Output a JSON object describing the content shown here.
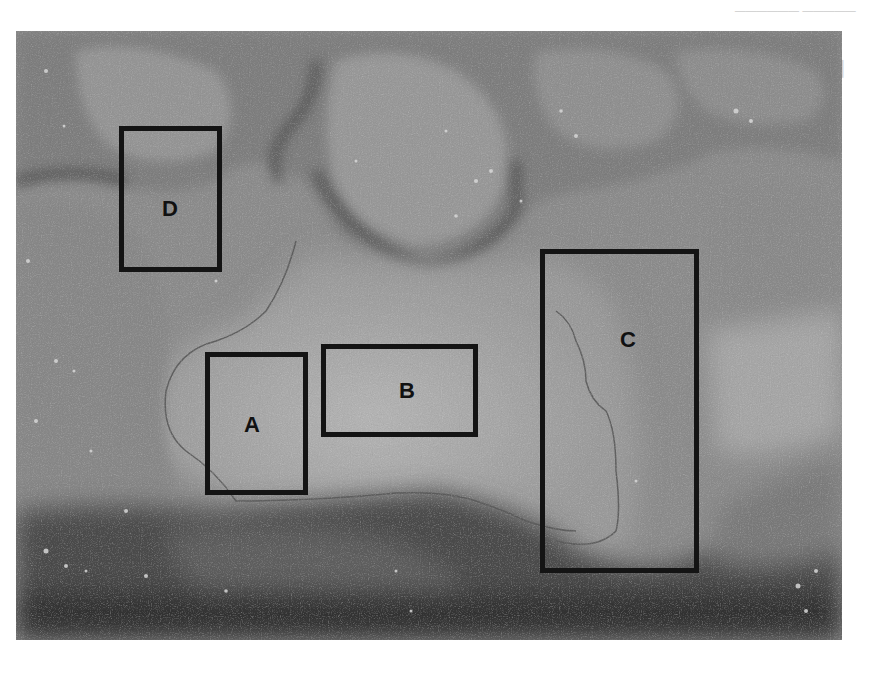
{
  "figure": {
    "type": "grayscale tissue photograph with annotated regions",
    "background_color": "#ffffff",
    "box_color": "#141414",
    "regions": [
      {
        "id": "A",
        "label": "A"
      },
      {
        "id": "B",
        "label": "B"
      },
      {
        "id": "C",
        "label": "C"
      },
      {
        "id": "D",
        "label": "D"
      }
    ]
  }
}
